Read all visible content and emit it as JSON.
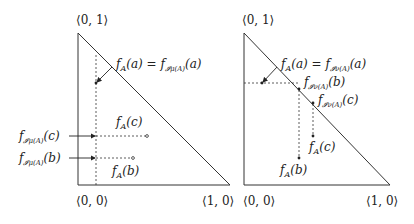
{
  "left_panel": {
    "vertex_top": "⟨0, 1⟩",
    "vertex_origin": "⟨0, 0⟩",
    "vertex_right": "⟨1, 0⟩",
    "eq_lhs": "f",
    "eq_lhs_sub": "A",
    "eq_lhs_arg": "(a) = ",
    "eq_rhs": "f",
    "eq_rhs_sub": "𝓘μ(A)",
    "eq_rhs_arg": "(a)",
    "fA_c": {
      "f": "f",
      "sub": "A",
      "arg": "(c)"
    },
    "fA_b": {
      "f": "f",
      "sub": "A",
      "arg": "(b)"
    },
    "fI_c": {
      "f": "f",
      "sub": "𝓘μ(A)",
      "arg": "(c)"
    },
    "fI_b": {
      "f": "f",
      "sub": "𝓘μ(A)",
      "arg": "(b)"
    }
  },
  "right_panel": {
    "vertex_top": "⟨0, 1⟩",
    "vertex_origin": "⟨0, 0⟩",
    "vertex_right": "⟨1, 0⟩",
    "eq_lhs": "f",
    "eq_lhs_sub": "A",
    "eq_lhs_arg": "(a) = ",
    "eq_rhs": "f",
    "eq_rhs_sub": "𝓘ν(A)",
    "eq_rhs_arg": "(a)",
    "fI_b": {
      "f": "f",
      "sub": "𝓘ν(A)",
      "arg": "(b)"
    },
    "fI_c": {
      "f": "f",
      "sub": "𝓘ν(A)",
      "arg": "(c)"
    },
    "fA_c": {
      "f": "f",
      "sub": "A",
      "arg": "(c)"
    },
    "fA_b": {
      "f": "f",
      "sub": "A",
      "arg": "(b)"
    }
  }
}
